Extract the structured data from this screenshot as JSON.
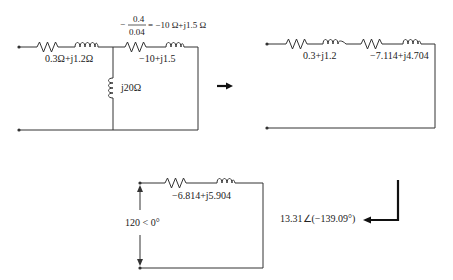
{
  "figure": {
    "colors": {
      "line": "#333333",
      "arrow": "#111111",
      "background": "#ffffff"
    }
  },
  "circuit1": {
    "series_impedance_label": "0.3Ω+j1.2Ω",
    "shunt_inductor_label": "j20Ω",
    "branch_label": "−10+j1.5",
    "annotation": {
      "prefix": "−",
      "numerator": "0.4",
      "denominator": "0.04",
      "result": "= −10 Ω+j1.5 Ω"
    }
  },
  "circuit2": {
    "impedance1_label": "0.3+j1.2",
    "impedance2_label": "−7.114+j4.704"
  },
  "circuit3": {
    "impedance_label": "−6.814+j5.904",
    "source_label": "120 < 0°",
    "current_label": "13.31∠(−139.09°)"
  },
  "arrows": [
    {
      "name": "arrow-right",
      "direction": "right"
    },
    {
      "name": "arrow-down-left",
      "direction": "down-then-left"
    }
  ]
}
